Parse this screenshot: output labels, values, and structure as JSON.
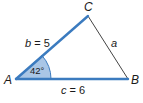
{
  "diagram": {
    "type": "triangle",
    "vertices": {
      "A": {
        "label": "A"
      },
      "B": {
        "label": "B"
      },
      "C": {
        "label": "C"
      }
    },
    "sides": {
      "b": {
        "label_var": "b",
        "label_eq": " = 5",
        "value": 5
      },
      "c": {
        "label_var": "c",
        "label_eq": " = 6",
        "value": 6
      },
      "a": {
        "label_var": "a"
      }
    },
    "angle_A": {
      "label": "42°",
      "value": 42
    },
    "colors": {
      "highlight_side": "#3b7bbf",
      "angle_fill": "#a9c6e6",
      "plain_side": "#444444"
    }
  }
}
